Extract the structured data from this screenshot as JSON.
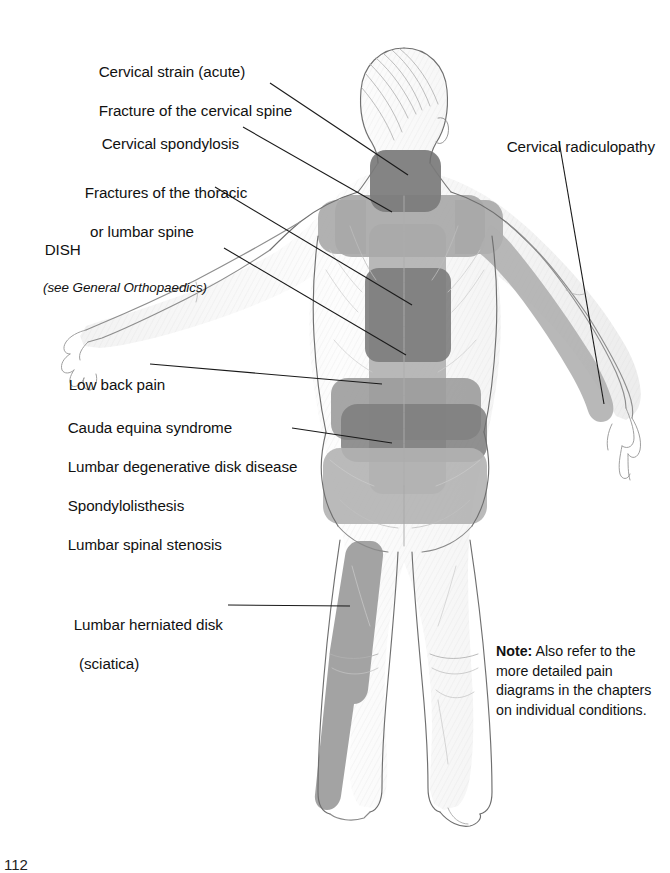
{
  "diagram": {
    "view": "posterior",
    "page_number": "112"
  },
  "labels": {
    "cervical_strain": {
      "line1": "Cervical strain (acute)",
      "line2": "Fracture of the cervical spine"
    },
    "cervical_spondylosis": "Cervical spondylosis",
    "thoracic_lumbar_fractures": {
      "line1": "Fractures of the thoracic",
      "line2": "or lumbar spine"
    },
    "dish": {
      "main": "DISH",
      "sub": "(see General Orthopaedics)"
    },
    "low_back_pain": "Low back pain",
    "lumbar_group": {
      "line1": "Cauda equina syndrome",
      "line2": "Lumbar degenerative disk disease",
      "line3": "Spondylolisthesis",
      "line4": "Lumbar spinal stenosis"
    },
    "herniated_disk": {
      "line1": "Lumbar herniated disk",
      "line2": "(sciatica)"
    },
    "cervical_radiculopathy": "Cervical radiculopathy"
  },
  "note": {
    "bold_prefix": "Note:",
    "body": " Also refer to the more detailed pain diagrams in the chapters on individual conditions."
  },
  "colors": {
    "pain_dark": "#7c7c7c",
    "pain_mid": "#969696",
    "pain_light": "#b2b2b2",
    "sketch_line": "#6d6d6d",
    "sketch_light": "#b9b9b9",
    "leader_line": "#1a1a1a",
    "text": "#111111",
    "background": "#ffffff"
  },
  "pain_regions": [
    {
      "name": "posterior-neck",
      "shade": "dark",
      "condition": "Cervical strain / cervical spine fracture"
    },
    {
      "name": "upper-back-shoulders-band",
      "shade": "light",
      "condition": "Cervical spondylosis"
    },
    {
      "name": "mid-thoracic-spine",
      "shade": "dark",
      "condition": "Fractures of the thoracic or lumbar spine"
    },
    {
      "name": "thoracolumbar-column",
      "shade": "light",
      "condition": "DISH"
    },
    {
      "name": "lower-back-band",
      "shade": "mid",
      "condition": "Low back pain"
    },
    {
      "name": "lumbosacral-band",
      "shade": "dark",
      "condition": "Cauda equina / lumbar degenerative disk disease / spondylolisthesis / lumbar spinal stenosis"
    },
    {
      "name": "buttock-region",
      "shade": "light",
      "condition": "Lumbar conditions referral"
    },
    {
      "name": "posterior-thigh-leg-stripe",
      "shade": "mid",
      "condition": "Lumbar herniated disk (sciatica)"
    },
    {
      "name": "right-arm-stripe",
      "shade": "light",
      "condition": "Cervical radiculopathy"
    }
  ]
}
